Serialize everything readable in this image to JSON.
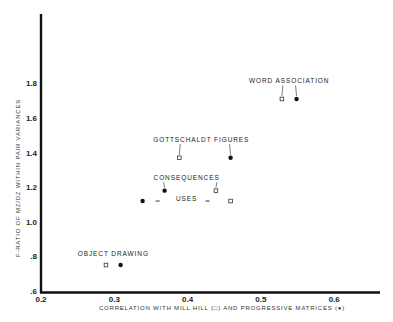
{
  "chart_data": {
    "type": "scatter",
    "title": "",
    "xlabel": "CORRELATION WITH MILL HILL (□) AND PROGRESSIVE MATRICES (●)",
    "ylabel": "F-RATIO OF MZ/DZ WITHIN PAIR VARIANCES",
    "xlim": [
      0.2,
      0.66
    ],
    "ylim": [
      0.6,
      2.05
    ],
    "x_ticks": [
      "0.2",
      "0.3",
      "0.4",
      "0.5",
      "0.6"
    ],
    "x_tick_values": [
      0.2,
      0.3,
      0.4,
      0.5,
      0.6
    ],
    "y_ticks": [
      ".6",
      ".8",
      "1.0",
      "1.2",
      "1.4",
      "1.6",
      "1.8"
    ],
    "y_tick_values": [
      0.6,
      0.8,
      1.0,
      1.2,
      1.4,
      1.6,
      1.8
    ],
    "grid": false,
    "legend": "encoded in x-axis label: open square = Mill Hill, filled circle = Progressive Matrices",
    "series": [
      {
        "name": "Mill Hill",
        "marker": "open-square",
        "points": [
          {
            "label": "OBJECT DRAWING",
            "x": 0.29,
            "y": 0.75
          },
          {
            "label": "USES",
            "x": 0.46,
            "y": 1.12
          },
          {
            "label": "CONSEQUENCES",
            "x": 0.44,
            "y": 1.18
          },
          {
            "label": "GOTTSCHALDT FIGURES",
            "x": 0.39,
            "y": 1.37
          },
          {
            "label": "WORD ASSOCIATION",
            "x": 0.53,
            "y": 1.71
          }
        ]
      },
      {
        "name": "Progressive Matrices",
        "marker": "filled-circle",
        "points": [
          {
            "label": "OBJECT DRAWING",
            "x": 0.31,
            "y": 0.75
          },
          {
            "label": "USES",
            "x": 0.34,
            "y": 1.12
          },
          {
            "label": "CONSEQUENCES",
            "x": 0.37,
            "y": 1.18
          },
          {
            "label": "GOTTSCHALDT FIGURES",
            "x": 0.46,
            "y": 1.37
          },
          {
            "label": "WORD ASSOCIATION",
            "x": 0.55,
            "y": 1.71
          }
        ]
      }
    ],
    "annotations": [
      {
        "text": "WORD ASSOCIATION",
        "x": 0.54,
        "y": 1.8
      },
      {
        "text": "GOTTSCHALDT FIGURES",
        "x": 0.42,
        "y": 1.46
      },
      {
        "text": "CONSEQUENCES",
        "x": 0.4,
        "y": 1.24
      },
      {
        "text": "USES",
        "x": 0.4,
        "y": 1.12
      },
      {
        "text": "OBJECT DRAWING",
        "x": 0.3,
        "y": 0.8
      }
    ]
  }
}
